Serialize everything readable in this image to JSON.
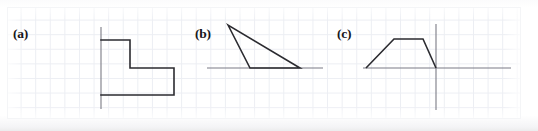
{
  "figure": {
    "caption_labels": {
      "a": "(a)",
      "b": "(b)",
      "c": "(c)"
    },
    "colors": {
      "shape_stroke": "#2b2b30",
      "axis_stroke": "#7b7b85",
      "grid_line": "#eceef3",
      "background": "#ffffff"
    },
    "panels": [
      {
        "id": "a",
        "label": "(a)",
        "description": "L-shaped step polygon drawn against a vertical axis line",
        "axes": [
          {
            "name": "vertical-axis",
            "type": "vertical",
            "x": 101,
            "y1": 27,
            "y2": 109
          }
        ],
        "shape": {
          "name": "l-step-polygon",
          "type": "polyline",
          "points": "101,40 130,40 130,68 174,68 174,95 101,95"
        }
      },
      {
        "id": "b",
        "label": "(b)",
        "description": "Narrow triangle with apex upper-left and base on the horizontal axis",
        "axes": [
          {
            "name": "horizontal-axis",
            "type": "horizontal",
            "y": 68,
            "x1": 207,
            "x2": 323
          }
        ],
        "shape": {
          "name": "thin-triangle",
          "type": "polygon",
          "points": "228,25 250,68 300,68"
        }
      },
      {
        "id": "c",
        "label": "(c)",
        "description": "Trapezoid sitting on the horizontal axis, crossed by a vertical axis at its right edge",
        "axes": [
          {
            "name": "horizontal-axis",
            "type": "horizontal",
            "y": 68,
            "x1": 363,
            "x2": 511
          },
          {
            "name": "vertical-axis",
            "type": "vertical",
            "x": 436,
            "y1": 24,
            "y2": 110
          }
        ],
        "shape": {
          "name": "trapezoid",
          "type": "polyline",
          "points": "366,68 394,39 423,39 436,68"
        }
      }
    ]
  }
}
